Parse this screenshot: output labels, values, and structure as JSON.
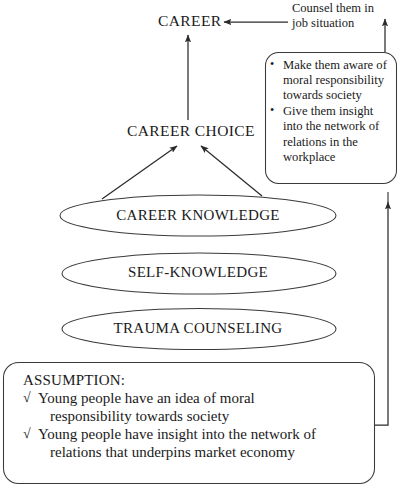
{
  "diagram": {
    "line_color": "#3a3a3a",
    "text_color": "#1a1a1a",
    "background": "#ffffff"
  },
  "nodes": {
    "career": {
      "label": "CAREER"
    },
    "career_choice": {
      "label": "CAREER CHOICE"
    },
    "ellipses": [
      {
        "label": "CAREER KNOWLEDGE"
      },
      {
        "label": "SELF-KNOWLEDGE"
      },
      {
        "label": "TRAUMA COUNSELING"
      }
    ]
  },
  "counsel_note": {
    "line1": "Counsel them in",
    "line2": "job situation"
  },
  "bullet_box": {
    "items": [
      "Make them aware of moral responsibility towards society",
      "Give them insight into the network of relations in the workplace"
    ]
  },
  "assumption_box": {
    "title": "ASSUMPTION:",
    "check_mark": "√",
    "items": [
      {
        "line1": "Young people have an idea of moral",
        "line2": "responsibility towards society"
      },
      {
        "line1": "Young people have insight into the network of",
        "line2": "relations that underpins market economy"
      }
    ]
  },
  "connectors": [
    {
      "name": "career-choice-to-career",
      "kind": "arrow-up"
    },
    {
      "name": "counsel-to-career",
      "kind": "arrow-left"
    },
    {
      "name": "bullet-box-to-counsel",
      "kind": "arrow-up"
    },
    {
      "name": "career-knowledge-left-to-career-choice",
      "kind": "arrow-up-right"
    },
    {
      "name": "career-knowledge-right-to-career-choice",
      "kind": "arrow-up-left"
    },
    {
      "name": "assumption-to-bullet-box",
      "kind": "arrow-up-long"
    }
  ]
}
